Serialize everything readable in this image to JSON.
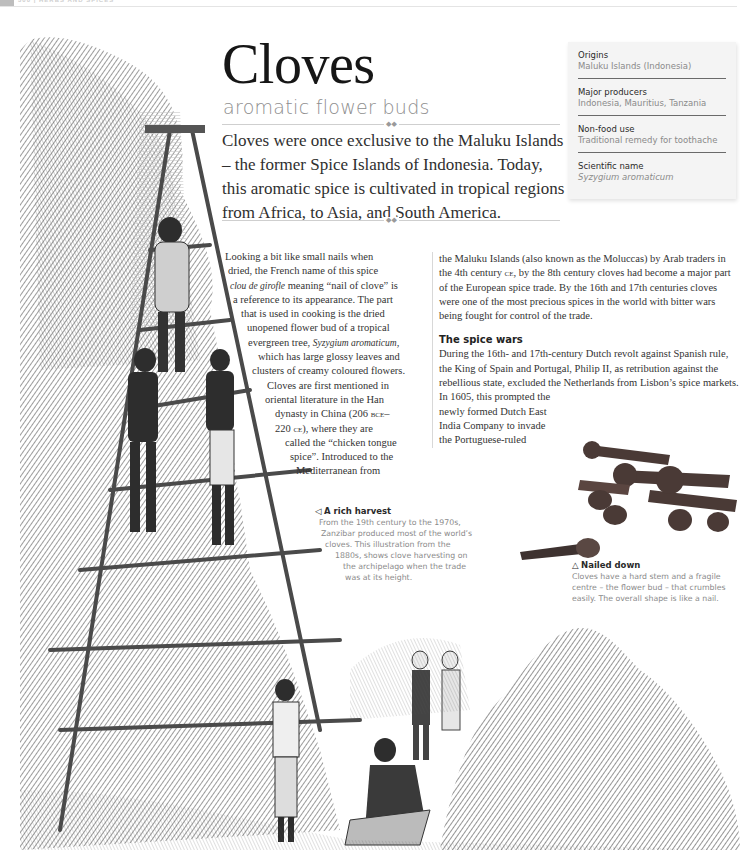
{
  "page_header": {
    "folio": "300 | HERBS AND SPICES"
  },
  "title": "Cloves",
  "subtitle": "aromatic flower buds",
  "ornament": "◆◆",
  "intro": "Cloves were once exclusive to the Maluku Islands – the former Spice Islands of Indonesia. Today, this aromatic spice is cultivated in tropical regions from Africa, to Asia, and South America.",
  "factbox": {
    "items": [
      {
        "label": "Origins",
        "value": "Maluku Islands (Indonesia)"
      },
      {
        "label": "Major producers",
        "value": "Indonesia, Mauritius, Tanzania"
      },
      {
        "label": "Non-food use",
        "value": "Traditional remedy for toothache"
      },
      {
        "label": "Scientific name",
        "value": "Syzygium aromaticum"
      }
    ]
  },
  "body_col1": {
    "lines": [
      "Looking a bit like small nails when",
      "dried, the French name of this spice",
      "clou de girofle",
      " meaning “nail of clove” is",
      "a reference to its appearance. The part",
      "that is used in cooking is the dried",
      "unopened flower bud of a tropical",
      "evergreen tree, ",
      "Syzygium aromaticum",
      ",",
      "which has large glossy leaves and",
      "clusters of creamy coloured flowers.",
      "Cloves are first mentioned in",
      "oriental literature in the Han",
      "dynasty in China (206 ",
      "bce",
      "–",
      "220 ",
      "ce",
      "), where they are",
      "called the “chicken tongue",
      "spice”. Introduced to the",
      "Mediterranean from"
    ]
  },
  "body_col2": {
    "para1_a": "the Maluku Islands (also known as the Moluccas) by Arab traders in the 4th century ",
    "para1_sc": "ce",
    "para1_b": ", by the 8th century cloves had become a major part of the European spice trade. By the 16th and 17th centuries cloves were one of the most precious spices in the world with bitter wars being fought for control of the trade.",
    "heading": "The spice wars",
    "para2": "During the 16th- and 17th-century Dutch revolt against Spanish rule, the King of Spain and Portugal, Philip II, as retribution against the rebellious state, excluded the Netherlands from Lisbon’s spice markets.",
    "para3": "In 1605, this prompted the newly formed Dutch East India Company to invade the Portuguese-ruled"
  },
  "caption_harvest": {
    "arrow": "◁",
    "heading": "A rich harvest",
    "lines": [
      "From the 19th century to the 1970s,",
      "Zanzibar produced most of the world’s",
      "cloves. This illustration from the",
      "1880s, shows clove harvesting on",
      "the archipelago when the trade",
      "was at its height."
    ]
  },
  "caption_cloves": {
    "arrow": "△",
    "heading": "Nailed down",
    "text": "Cloves have a hard stem and a fragile centre – the flower bud – that crumbles easily. The overall shape is like a nail."
  }
}
